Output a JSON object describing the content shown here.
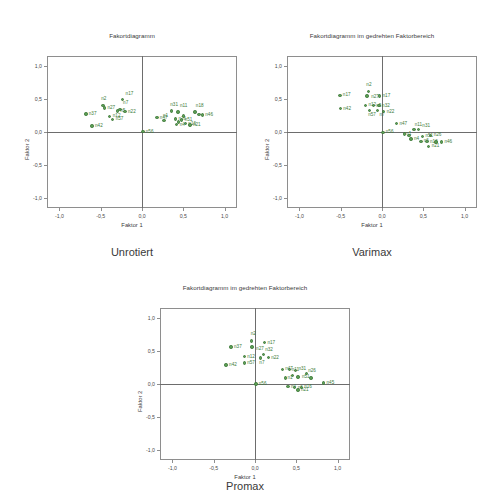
{
  "page": {
    "background": "#ffffff",
    "marker_color": "#5d9e56",
    "marker_edge_color": "#3f7a3a",
    "label_color": "#3c7a38",
    "axis_color": "#8e8e8e"
  },
  "captions": {
    "unrotated": "Unrotiert",
    "varimax": "Varimax",
    "promax": "Promax"
  },
  "chart_data": [
    {
      "id": "unrotated",
      "type": "scatter",
      "title": "Fakortdiagramm",
      "xlabel": "Faktor 1",
      "ylabel": "Faktor 2",
      "xlim": [
        -1.15,
        1.15
      ],
      "ylim": [
        -1.15,
        1.15
      ],
      "xticks": [
        -1.0,
        -0.5,
        0.0,
        0.5,
        1.0
      ],
      "yticks": [
        -1.0,
        -0.5,
        0.0,
        0.5,
        1.0
      ],
      "xticklabels": [
        "-1,0",
        "-0,5",
        "0,0",
        "0,5",
        "1,0"
      ],
      "yticklabels": [
        "-1,0",
        "-0,5",
        "0,0",
        "0,5",
        "1,0"
      ],
      "grid": false,
      "legend": "none",
      "points": [
        {
          "label": "n17",
          "x": -0.235,
          "y": 0.495,
          "lx": 3,
          "ly": -7
        },
        {
          "label": "n2",
          "x": -0.47,
          "y": 0.4,
          "lx": -2,
          "ly": -9
        },
        {
          "label": "n27",
          "x": -0.455,
          "y": 0.365,
          "lx": 3,
          "ly": -2
        },
        {
          "label": "n7",
          "x": -0.265,
          "y": 0.345,
          "lx": 3,
          "ly": -8
        },
        {
          "label": "n5",
          "x": -0.3,
          "y": 0.32,
          "lx": 3,
          "ly": -2
        },
        {
          "label": "n22",
          "x": -0.205,
          "y": 0.31,
          "lx": 3,
          "ly": -2
        },
        {
          "label": "n37",
          "x": -0.68,
          "y": 0.275,
          "lx": 3,
          "ly": -2
        },
        {
          "label": "n12",
          "x": -0.39,
          "y": 0.235,
          "lx": 3,
          "ly": -2
        },
        {
          "label": "n57",
          "x": -0.355,
          "y": 0.19,
          "lx": 3,
          "ly": -2
        },
        {
          "label": "n42",
          "x": -0.605,
          "y": 0.09,
          "lx": 3,
          "ly": -2
        },
        {
          "label": "n56",
          "x": 0.01,
          "y": 0.005,
          "lx": 3,
          "ly": -2
        },
        {
          "label": "n31",
          "x": 0.355,
          "y": 0.32,
          "lx": -1,
          "ly": -8
        },
        {
          "label": "n11",
          "x": 0.435,
          "y": 0.3,
          "lx": 2,
          "ly": -8
        },
        {
          "label": "n18",
          "x": 0.64,
          "y": 0.3,
          "lx": 1,
          "ly": -8
        },
        {
          "label": "n46",
          "x": 0.73,
          "y": 0.255,
          "lx": 3,
          "ly": -2
        },
        {
          "label": "n47",
          "x": 0.18,
          "y": 0.215,
          "lx": 3,
          "ly": -2
        },
        {
          "label": "n1",
          "x": 0.265,
          "y": 0.17,
          "lx": -1,
          "ly": -7
        },
        {
          "label": "n26",
          "x": 0.405,
          "y": 0.195,
          "lx": 3,
          "ly": -2
        },
        {
          "label": "n51",
          "x": 0.48,
          "y": 0.18,
          "lx": 3,
          "ly": -2
        },
        {
          "label": "n4",
          "x": 0.42,
          "y": 0.11,
          "lx": 3,
          "ly": -2
        },
        {
          "label": "n16",
          "x": 0.525,
          "y": 0.125,
          "lx": 3,
          "ly": -2
        },
        {
          "label": "n21",
          "x": 0.58,
          "y": 0.105,
          "lx": 3,
          "ly": -2
        },
        {
          "label": "n6",
          "x": 0.445,
          "y": 0.15,
          "lx": 0,
          "ly": 0
        },
        {
          "label": "n32",
          "x": 0.5,
          "y": 0.24,
          "lx": 0,
          "ly": 0
        },
        {
          "label": "n36",
          "x": 0.69,
          "y": 0.265,
          "lx": 0,
          "ly": 0
        }
      ]
    },
    {
      "id": "varimax",
      "type": "scatter",
      "title": "Fakortdiagramm im gedrehten Faktorbereich",
      "xlabel": "Faktor 1",
      "ylabel": "Faktor 2",
      "xlim": [
        -1.15,
        1.15
      ],
      "ylim": [
        -1.15,
        1.15
      ],
      "xticks": [
        -1.0,
        -0.5,
        0.0,
        0.5,
        1.0
      ],
      "yticks": [
        -1.0,
        -0.5,
        0.0,
        0.5,
        1.0
      ],
      "xticklabels": [
        "-1,0",
        "-0,5",
        "0,0",
        "0,5",
        "1,0"
      ],
      "yticklabels": [
        "-1,0",
        "-0,5",
        "0,0",
        "0,5",
        "1,0"
      ],
      "grid": false,
      "legend": "none",
      "points": [
        {
          "label": "n2",
          "x": -0.165,
          "y": 0.61,
          "lx": -2,
          "ly": -9
        },
        {
          "label": "n17",
          "x": -0.51,
          "y": 0.555,
          "lx": 3,
          "ly": -2
        },
        {
          "label": "n27",
          "x": -0.18,
          "y": 0.545,
          "lx": 4,
          "ly": -1
        },
        {
          "label": "n17",
          "x": -0.03,
          "y": 0.545,
          "lx": 3,
          "ly": -2
        },
        {
          "label": "n12",
          "x": -0.2,
          "y": 0.405,
          "lx": 3,
          "ly": -2
        },
        {
          "label": "n5",
          "x": -0.105,
          "y": 0.4,
          "lx": 3,
          "ly": -2
        },
        {
          "label": "n32",
          "x": -0.035,
          "y": 0.4,
          "lx": 3,
          "ly": -2
        },
        {
          "label": "n42",
          "x": -0.505,
          "y": 0.355,
          "lx": 3,
          "ly": -2
        },
        {
          "label": "n57",
          "x": -0.155,
          "y": 0.33,
          "lx": -1,
          "ly": 3
        },
        {
          "label": "n7",
          "x": -0.055,
          "y": 0.33,
          "lx": 2,
          "ly": 3
        },
        {
          "label": "n22",
          "x": 0.02,
          "y": 0.31,
          "lx": 3,
          "ly": -2
        },
        {
          "label": "n47",
          "x": 0.175,
          "y": 0.125,
          "lx": 3,
          "ly": -2
        },
        {
          "label": "n11",
          "x": 0.385,
          "y": 0.04,
          "lx": 1,
          "ly": -6
        },
        {
          "label": "n31",
          "x": 0.44,
          "y": 0.04,
          "lx": 4,
          "ly": -5
        },
        {
          "label": "n56",
          "x": 0.01,
          "y": -0.005,
          "lx": 3,
          "ly": -2
        },
        {
          "label": "n1",
          "x": 0.27,
          "y": -0.03,
          "lx": 2,
          "ly": -2
        },
        {
          "label": "n26",
          "x": 0.59,
          "y": -0.055,
          "lx": 3,
          "ly": -3
        },
        {
          "label": "n51",
          "x": 0.49,
          "y": -0.065,
          "lx": 3,
          "ly": -2
        },
        {
          "label": "n4",
          "x": 0.35,
          "y": -0.105,
          "lx": 3,
          "ly": -2
        },
        {
          "label": "n6",
          "x": 0.47,
          "y": -0.14,
          "lx": 3,
          "ly": -2
        },
        {
          "label": "n16",
          "x": 0.545,
          "y": -0.145,
          "lx": 3,
          "ly": -2
        },
        {
          "label": "n46",
          "x": 0.72,
          "y": -0.15,
          "lx": 3,
          "ly": -2
        },
        {
          "label": "n21",
          "x": 0.565,
          "y": -0.215,
          "lx": 3,
          "ly": -2
        },
        {
          "label": "n36",
          "x": 0.325,
          "y": -0.055,
          "lx": 0,
          "ly": 0
        },
        {
          "label": "n18",
          "x": 0.655,
          "y": -0.15,
          "lx": 0,
          "ly": 0
        }
      ]
    },
    {
      "id": "promax",
      "type": "scatter",
      "title": "Fakortdiagramm im gedrehten Faktorbereich",
      "xlabel": "Faktor 1",
      "ylabel": "Faktor 2",
      "xlim": [
        -1.15,
        1.15
      ],
      "ylim": [
        -1.15,
        1.15
      ],
      "xticks": [
        -1.0,
        -0.5,
        0.0,
        0.5,
        1.0
      ],
      "yticks": [
        -1.0,
        -0.5,
        0.0,
        0.5,
        1.0
      ],
      "xticklabels": [
        "-1,0",
        "-0,5",
        "0,0",
        "0,5",
        "1,0"
      ],
      "yticklabels": [
        "-1,0",
        "-0,5",
        "0,0",
        "0,5",
        "1,0"
      ],
      "grid": false,
      "legend": "none",
      "points": [
        {
          "label": "n2",
          "x": -0.04,
          "y": 0.65,
          "lx": -1,
          "ly": -9
        },
        {
          "label": "n17",
          "x": 0.115,
          "y": 0.625,
          "lx": 3,
          "ly": -2
        },
        {
          "label": "n37",
          "x": -0.29,
          "y": 0.56,
          "lx": 3,
          "ly": -2
        },
        {
          "label": "n27",
          "x": -0.035,
          "y": 0.56,
          "lx": 4,
          "ly": 0
        },
        {
          "label": "n32",
          "x": 0.1,
          "y": 0.45,
          "lx": 2,
          "ly": -6
        },
        {
          "label": "n12",
          "x": -0.13,
          "y": 0.415,
          "lx": 3,
          "ly": -2
        },
        {
          "label": "n22",
          "x": 0.16,
          "y": 0.4,
          "lx": 3,
          "ly": -2
        },
        {
          "label": "n7",
          "x": 0.065,
          "y": 0.395,
          "lx": -1,
          "ly": 3
        },
        {
          "label": "n57",
          "x": -0.13,
          "y": 0.32,
          "lx": 3,
          "ly": -2
        },
        {
          "label": "n42",
          "x": -0.35,
          "y": 0.285,
          "lx": 3,
          "ly": -2
        },
        {
          "label": "n47",
          "x": 0.33,
          "y": 0.22,
          "lx": 3,
          "ly": -2
        },
        {
          "label": "n11",
          "x": 0.42,
          "y": 0.215,
          "lx": 2,
          "ly": -2
        },
        {
          "label": "n31",
          "x": 0.49,
          "y": 0.205,
          "lx": 3,
          "ly": -3
        },
        {
          "label": "n26",
          "x": 0.62,
          "y": 0.155,
          "lx": 2,
          "ly": -5
        },
        {
          "label": "n51",
          "x": 0.52,
          "y": 0.105,
          "lx": 4,
          "ly": -2
        },
        {
          "label": "n1",
          "x": 0.37,
          "y": 0.09,
          "lx": 2,
          "ly": -2
        },
        {
          "label": "n56",
          "x": 0.01,
          "y": 0.0,
          "lx": 3,
          "ly": -2
        },
        {
          "label": "n45",
          "x": 0.83,
          "y": 0.015,
          "lx": 3,
          "ly": -2
        },
        {
          "label": "n4",
          "x": 0.4,
          "y": -0.04,
          "lx": 3,
          "ly": -2
        },
        {
          "label": "n6",
          "x": 0.48,
          "y": -0.055,
          "lx": 3,
          "ly": -2
        },
        {
          "label": "n16",
          "x": 0.56,
          "y": -0.05,
          "lx": 3,
          "ly": -2
        },
        {
          "label": "n21",
          "x": 0.52,
          "y": -0.09,
          "lx": 3,
          "ly": -2
        },
        {
          "label": "n18",
          "x": 0.68,
          "y": 0.09,
          "lx": 0,
          "ly": 0
        },
        {
          "label": "n36",
          "x": 0.455,
          "y": 0.125,
          "lx": 0,
          "ly": 0
        }
      ]
    }
  ]
}
